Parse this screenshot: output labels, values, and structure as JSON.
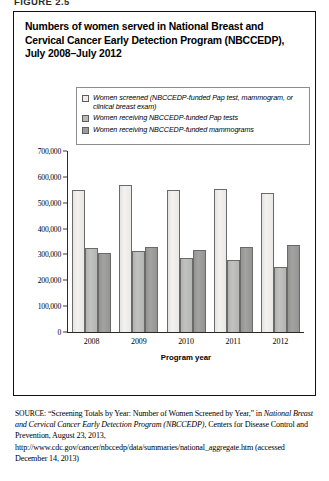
{
  "figure_label": "FIGURE 2.5",
  "title": "Numbers of women served in National Breast and Cervical Cancer Early Detection Program (NBCCEDP), July 2008–July 2012",
  "legend": {
    "items": [
      {
        "label": "Women screened (NBCCEDP-funded Pap test, mammogram, or clinical breast exam)",
        "swatch_color": "#eeedeb",
        "icon": "legend-swatch-icon"
      },
      {
        "label": "Women receiving NBCCEDP-funded Pap tests",
        "swatch_color": "#b9b9b7",
        "icon": "legend-swatch-icon"
      },
      {
        "label": "Women receiving NBCCEDP-funded mammograms",
        "swatch_color": "#9a9a98",
        "icon": "legend-swatch-icon"
      }
    ]
  },
  "axes": {
    "x_title": "Program year",
    "y_tick_labels": [
      "700,000",
      "600,000",
      "500,000",
      "400,000",
      "300,000",
      "200,000",
      "100,000",
      "0"
    ],
    "x_tick_labels": [
      "2008",
      "2009",
      "2010",
      "2011",
      "2012"
    ]
  },
  "source": {
    "prefix": "SOURCE:",
    "text_1": " “Screening Totals by Year: Number of Women Screened by Year,” in ",
    "italic_1": "National Breast and Cervical Cancer Early Detection Program (NBCCEDP)",
    "text_2": ", Centers for Disease Control and Prevention, August 23, 2013, http://www.cdc.gov/cancer/nbccedp/data/summaries/national_aggregate.htm (accessed December 14, 2013)"
  },
  "chart_data": {
    "type": "bar",
    "title": "Numbers of women served in National Breast and Cervical Cancer Early Detection Program (NBCCEDP), July 2008–July 2012",
    "xlabel": "Program year",
    "ylabel": "",
    "ylim": [
      0,
      700000
    ],
    "ytick_interval": 100000,
    "grid": false,
    "legend_position": "top-inside",
    "categories": [
      "2008",
      "2009",
      "2010",
      "2011",
      "2012"
    ],
    "series": [
      {
        "name": "Women screened (NBCCEDP-funded Pap test, mammogram, or clinical breast exam)",
        "values": [
          548000,
          570000,
          550000,
          555000,
          538000
        ],
        "color": "#eeedeb"
      },
      {
        "name": "Women receiving NBCCEDP-funded Pap tests",
        "values": [
          325000,
          312000,
          288000,
          280000,
          252000
        ],
        "color": "#b9b9b7"
      },
      {
        "name": "Women receiving NBCCEDP-funded mammograms",
        "values": [
          305000,
          330000,
          318000,
          330000,
          338000
        ],
        "color": "#9a9a98"
      }
    ]
  }
}
